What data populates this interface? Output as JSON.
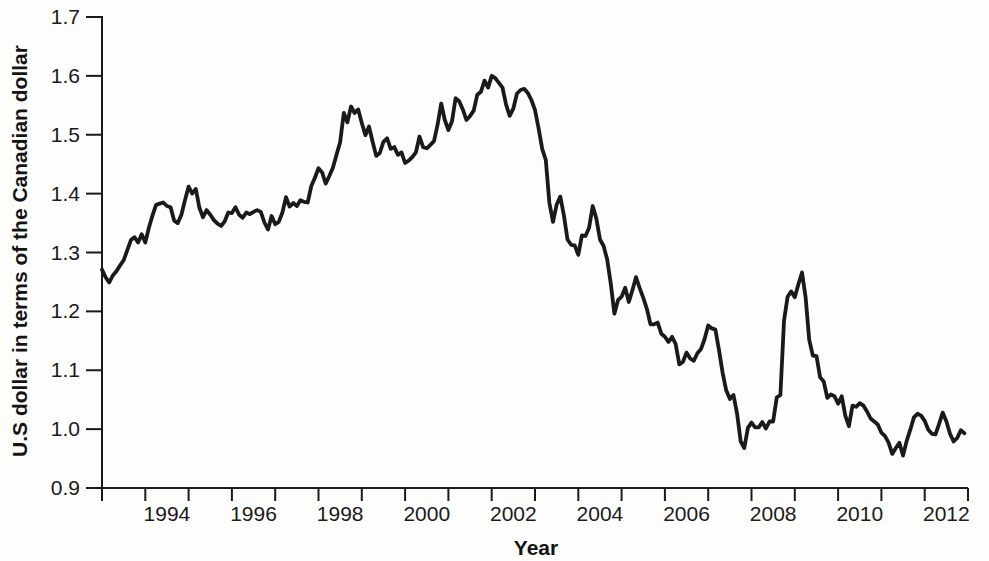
{
  "chart_data": {
    "type": "line",
    "title": "",
    "xlabel": "Year",
    "ylabel": "U.S dollar in terms of the Canadian dollar",
    "x_range": [
      1993,
      2013
    ],
    "ylim": [
      0.9,
      1.7
    ],
    "y_tick_step": 0.1,
    "y_tick_labels": [
      "0.9",
      "1.0",
      "1.1",
      "1.2",
      "1.3",
      "1.4",
      "1.5",
      "1.6",
      "1.7"
    ],
    "x_labeled_years": [
      1994,
      1996,
      1998,
      2000,
      2002,
      2004,
      2006,
      2008,
      2010,
      2012
    ],
    "grid": false,
    "legend": "none",
    "line_color": "#1a1a1a",
    "axis_color": "#1a1a1a",
    "series": [
      {
        "name": "U.S. dollar price in Canadian dollars",
        "start_year": 1993,
        "frequency": "monthly",
        "values": [
          1.271,
          1.258,
          1.249,
          1.261,
          1.268,
          1.278,
          1.287,
          1.304,
          1.321,
          1.326,
          1.317,
          1.331,
          1.317,
          1.342,
          1.363,
          1.381,
          1.383,
          1.385,
          1.379,
          1.377,
          1.354,
          1.35,
          1.364,
          1.389,
          1.412,
          1.4,
          1.408,
          1.376,
          1.36,
          1.372,
          1.364,
          1.355,
          1.349,
          1.345,
          1.353,
          1.368,
          1.367,
          1.377,
          1.364,
          1.359,
          1.368,
          1.365,
          1.369,
          1.372,
          1.369,
          1.351,
          1.339,
          1.362,
          1.348,
          1.352,
          1.368,
          1.394,
          1.378,
          1.384,
          1.379,
          1.389,
          1.386,
          1.385,
          1.413,
          1.427,
          1.443,
          1.436,
          1.417,
          1.43,
          1.444,
          1.466,
          1.487,
          1.537,
          1.521,
          1.548,
          1.537,
          1.543,
          1.52,
          1.499,
          1.514,
          1.488,
          1.464,
          1.469,
          1.488,
          1.494,
          1.476,
          1.479,
          1.466,
          1.47,
          1.452,
          1.456,
          1.462,
          1.47,
          1.497,
          1.479,
          1.477,
          1.483,
          1.489,
          1.517,
          1.553,
          1.525,
          1.508,
          1.523,
          1.562,
          1.557,
          1.543,
          1.525,
          1.532,
          1.541,
          1.568,
          1.573,
          1.592,
          1.58,
          1.6,
          1.596,
          1.588,
          1.58,
          1.551,
          1.532,
          1.545,
          1.57,
          1.576,
          1.578,
          1.571,
          1.559,
          1.542,
          1.511,
          1.476,
          1.457,
          1.384,
          1.352,
          1.381,
          1.395,
          1.363,
          1.322,
          1.313,
          1.312,
          1.296,
          1.329,
          1.328,
          1.342,
          1.379,
          1.358,
          1.322,
          1.311,
          1.288,
          1.247,
          1.196,
          1.219,
          1.225,
          1.24,
          1.216,
          1.236,
          1.258,
          1.24,
          1.223,
          1.204,
          1.178,
          1.178,
          1.181,
          1.162,
          1.157,
          1.148,
          1.157,
          1.144,
          1.11,
          1.114,
          1.13,
          1.12,
          1.116,
          1.129,
          1.136,
          1.153,
          1.176,
          1.171,
          1.169,
          1.134,
          1.096,
          1.066,
          1.051,
          1.058,
          1.026,
          0.979,
          0.968,
          1.002,
          1.011,
          1.003,
          1.003,
          1.012,
          1.001,
          1.013,
          1.013,
          1.054,
          1.058,
          1.184,
          1.225,
          1.234,
          1.224,
          1.246,
          1.266,
          1.224,
          1.152,
          1.125,
          1.124,
          1.088,
          1.081,
          1.053,
          1.059,
          1.056,
          1.043,
          1.056,
          1.023,
          1.005,
          1.04,
          1.038,
          1.044,
          1.04,
          1.03,
          1.018,
          1.013,
          1.008,
          0.994,
          0.988,
          0.977,
          0.958,
          0.968,
          0.977,
          0.955,
          0.98,
          0.999,
          1.02,
          1.026,
          1.023,
          1.014,
          0.999,
          0.992,
          0.991,
          1.009,
          1.028,
          1.013,
          0.992,
          0.979,
          0.985,
          0.998,
          0.993
        ]
      }
    ]
  }
}
